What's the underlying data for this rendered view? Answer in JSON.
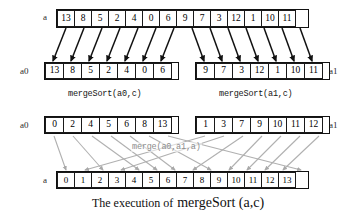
{
  "figure": {
    "caption_lead": "The execution of",
    "caption_code": "mergeSort (a,c)"
  },
  "rows": {
    "input": {
      "label": "a",
      "values": [
        "13",
        "8",
        "5",
        "2",
        "4",
        "0",
        "6",
        "9",
        "7",
        "3",
        "12",
        "1",
        "10",
        "11"
      ]
    },
    "split_left": {
      "label": "a0",
      "values": [
        "13",
        "8",
        "5",
        "2",
        "4",
        "0",
        "6"
      ],
      "call": "mergeSort(a0,c)"
    },
    "split_right": {
      "label": "a1",
      "values": [
        "9",
        "7",
        "3",
        "12",
        "1",
        "10",
        "11"
      ],
      "call": "mergeSort(a1,c)"
    },
    "sorted_left": {
      "label": "a0",
      "values": [
        "0",
        "2",
        "4",
        "5",
        "6",
        "8",
        "13"
      ]
    },
    "sorted_right": {
      "label": "a1",
      "values": [
        "1",
        "3",
        "7",
        "9",
        "10",
        "11",
        "12"
      ]
    },
    "merge": {
      "call": "merge(a0,a1,a)"
    },
    "output": {
      "label": "a",
      "values": [
        "0",
        "1",
        "2",
        "3",
        "4",
        "5",
        "6",
        "7",
        "8",
        "9",
        "10",
        "11",
        "12",
        "13"
      ]
    }
  },
  "colors": {
    "cell_border": "#1a1a1a",
    "split_arrow": "#111111",
    "merge_arrow": "#a8a8a8",
    "text": "#000000"
  }
}
